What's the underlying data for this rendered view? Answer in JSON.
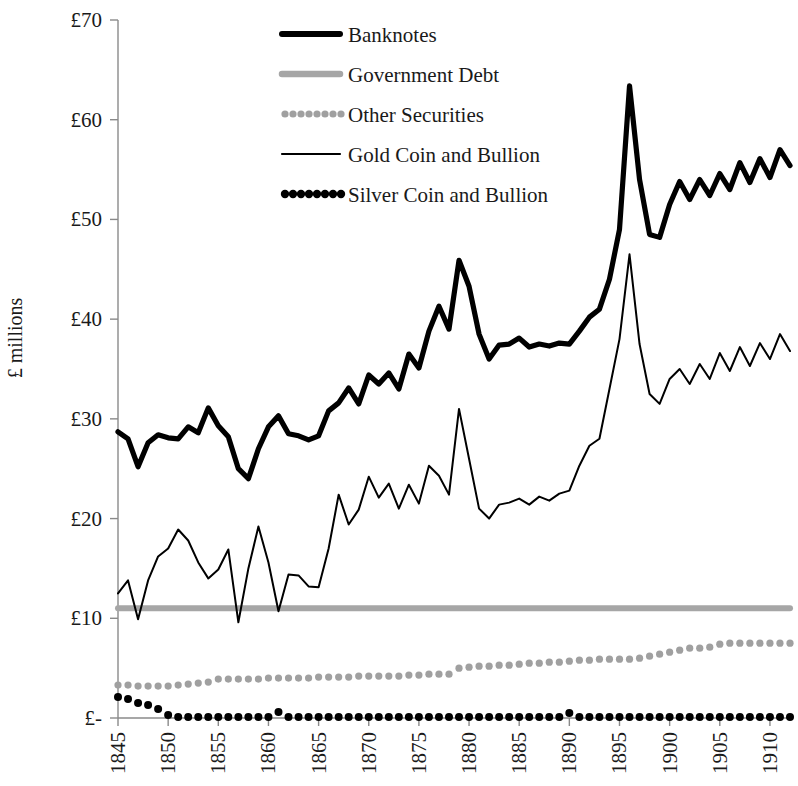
{
  "chart_data": {
    "type": "line",
    "title": "",
    "xlabel": "",
    "ylabel": "£ millions",
    "xlim": [
      1845,
      1912
    ],
    "ylim": [
      0,
      70
    ],
    "ytick_labels": [
      "£70",
      "£60",
      "£50",
      "£40",
      "£30",
      "£20",
      "£10",
      "£-"
    ],
    "ytick_values": [
      70,
      60,
      50,
      40,
      30,
      20,
      10,
      0
    ],
    "xtick_labels": [
      "1845",
      "1850",
      "1855",
      "1860",
      "1865",
      "1870",
      "1875",
      "1880",
      "1885",
      "1890",
      "1895",
      "1900",
      "1905",
      "1910"
    ],
    "xtick_values": [
      1845,
      1850,
      1855,
      1860,
      1865,
      1870,
      1875,
      1880,
      1885,
      1890,
      1895,
      1900,
      1905,
      1910
    ],
    "grid": false,
    "legend_position": "top-center",
    "x": [
      1845,
      1846,
      1847,
      1848,
      1849,
      1850,
      1851,
      1852,
      1853,
      1854,
      1855,
      1856,
      1857,
      1858,
      1859,
      1860,
      1861,
      1862,
      1863,
      1864,
      1865,
      1866,
      1867,
      1868,
      1869,
      1870,
      1871,
      1872,
      1873,
      1874,
      1875,
      1876,
      1877,
      1878,
      1879,
      1880,
      1881,
      1882,
      1883,
      1884,
      1885,
      1886,
      1887,
      1888,
      1889,
      1890,
      1891,
      1892,
      1893,
      1894,
      1895,
      1896,
      1897,
      1898,
      1899,
      1900,
      1901,
      1902,
      1903,
      1904,
      1905,
      1906,
      1907,
      1908,
      1909,
      1910,
      1911,
      1912
    ],
    "series": [
      {
        "name": "Banknotes",
        "style": "thick-solid",
        "color": "#000000",
        "values": [
          28.7,
          28.0,
          25.2,
          27.6,
          28.4,
          28.1,
          28.0,
          29.2,
          28.6,
          31.1,
          29.3,
          28.2,
          25.0,
          24.0,
          27.0,
          29.2,
          30.3,
          28.5,
          28.3,
          27.9,
          28.3,
          30.8,
          31.6,
          33.1,
          31.5,
          34.4,
          33.5,
          34.6,
          33.0,
          36.5,
          35.1,
          38.8,
          41.3,
          39.0,
          45.9,
          43.3,
          38.5,
          36.0,
          37.4,
          37.5,
          38.1,
          37.2,
          37.5,
          37.3,
          37.6,
          37.5,
          38.8,
          40.2,
          41.0,
          44.0,
          49.0,
          63.4,
          54.0,
          48.5,
          48.2,
          51.5,
          53.8,
          52.0,
          54.0,
          52.4,
          54.6,
          53.0,
          55.7,
          53.7,
          56.1,
          54.2,
          57.0,
          55.4
        ]
      },
      {
        "name": "Government Debt",
        "style": "thick-gray",
        "color": "#a6a6a6",
        "values": [
          11.0,
          11.0,
          11.0,
          11.0,
          11.0,
          11.0,
          11.0,
          11.0,
          11.0,
          11.0,
          11.0,
          11.0,
          11.0,
          11.0,
          11.0,
          11.0,
          11.0,
          11.0,
          11.0,
          11.0,
          11.0,
          11.0,
          11.0,
          11.0,
          11.0,
          11.0,
          11.0,
          11.0,
          11.0,
          11.0,
          11.0,
          11.0,
          11.0,
          11.0,
          11.0,
          11.0,
          11.0,
          11.0,
          11.0,
          11.0,
          11.0,
          11.0,
          11.0,
          11.0,
          11.0,
          11.0,
          11.0,
          11.0,
          11.0,
          11.0,
          11.0,
          11.0,
          11.0,
          11.0,
          11.0,
          11.0,
          11.0,
          11.0,
          11.0,
          11.0,
          11.0,
          11.0,
          11.0,
          11.0,
          11.0,
          11.0,
          11.0,
          11.0
        ]
      },
      {
        "name": "Other Securities",
        "style": "dotted-gray",
        "color": "#a0a0a0",
        "values": [
          3.3,
          3.3,
          3.2,
          3.2,
          3.2,
          3.2,
          3.3,
          3.4,
          3.5,
          3.6,
          3.9,
          3.9,
          3.9,
          3.9,
          3.9,
          4.0,
          4.0,
          4.0,
          4.0,
          4.0,
          4.1,
          4.1,
          4.1,
          4.1,
          4.2,
          4.2,
          4.2,
          4.2,
          4.2,
          4.3,
          4.3,
          4.4,
          4.4,
          4.4,
          5.0,
          5.1,
          5.2,
          5.2,
          5.3,
          5.3,
          5.4,
          5.5,
          5.5,
          5.6,
          5.6,
          5.7,
          5.8,
          5.8,
          5.9,
          5.9,
          5.9,
          5.9,
          6.0,
          6.2,
          6.4,
          6.6,
          6.8,
          7.0,
          7.0,
          7.1,
          7.4,
          7.5,
          7.5,
          7.5,
          7.5,
          7.5,
          7.5,
          7.5
        ]
      },
      {
        "name": "Gold Coin and Bullion",
        "style": "thin-solid",
        "color": "#000000",
        "values": [
          12.5,
          13.8,
          9.9,
          13.8,
          16.2,
          17.0,
          18.9,
          17.8,
          15.6,
          14.0,
          14.9,
          16.9,
          9.6,
          15.0,
          19.2,
          15.6,
          10.7,
          14.4,
          14.3,
          13.2,
          13.1,
          17.0,
          22.4,
          19.4,
          20.9,
          24.2,
          22.1,
          23.5,
          21.0,
          23.4,
          21.5,
          25.3,
          24.3,
          22.4,
          31.0,
          26.0,
          21.0,
          20.0,
          21.4,
          21.6,
          22.0,
          21.4,
          22.2,
          21.8,
          22.5,
          22.8,
          25.3,
          27.3,
          28.0,
          33.0,
          38.0,
          46.5,
          37.5,
          32.5,
          31.5,
          34.0,
          35.0,
          33.5,
          35.5,
          34.0,
          36.6,
          34.8,
          37.2,
          35.3,
          37.6,
          36.0,
          38.5,
          36.8
        ]
      },
      {
        "name": "Silver Coin and Bullion",
        "style": "dotted-black",
        "color": "#000000",
        "values": [
          2.1,
          1.9,
          1.5,
          1.3,
          0.9,
          0.3,
          0.1,
          0.1,
          0.1,
          0.1,
          0.1,
          0.1,
          0.1,
          0.1,
          0.1,
          0.1,
          0.6,
          0.1,
          0.1,
          0.1,
          0.1,
          0.1,
          0.1,
          0.1,
          0.1,
          0.1,
          0.1,
          0.1,
          0.1,
          0.1,
          0.1,
          0.1,
          0.1,
          0.1,
          0.1,
          0.1,
          0.1,
          0.1,
          0.1,
          0.1,
          0.1,
          0.1,
          0.1,
          0.1,
          0.1,
          0.5,
          0.1,
          0.1,
          0.1,
          0.1,
          0.1,
          0.1,
          0.1,
          0.1,
          0.1,
          0.1,
          0.1,
          0.1,
          0.1,
          0.1,
          0.1,
          0.1,
          0.1,
          0.1,
          0.1,
          0.1,
          0.1,
          0.1
        ]
      }
    ]
  },
  "legend": {
    "items": [
      {
        "label": "Banknotes",
        "swatch": "thick-solid"
      },
      {
        "label": "Government Debt",
        "swatch": "thick-gray"
      },
      {
        "label": "Other Securities",
        "swatch": "dotted-gray"
      },
      {
        "label": "Gold Coin and Bullion",
        "swatch": "thin-solid"
      },
      {
        "label": "Silver Coin and Bullion",
        "swatch": "dotted-black"
      }
    ]
  }
}
